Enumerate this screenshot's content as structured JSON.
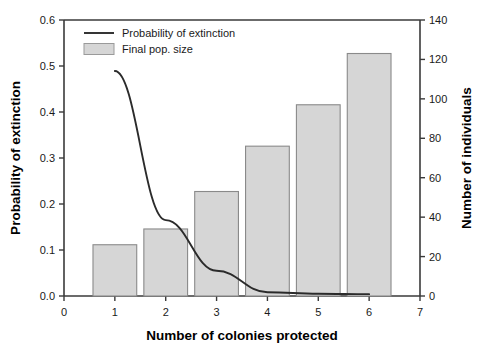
{
  "chart_data": {
    "type": "bar",
    "title": "",
    "subtitle": "",
    "xlabel": "Number of colonies protected",
    "ylabel": "Probability of extinction",
    "y2label": "Number of individuals",
    "categories": [
      "1",
      "2",
      "3",
      "4",
      "5",
      "6"
    ],
    "x": [
      1,
      2,
      3,
      4,
      5,
      6
    ],
    "xlim": [
      0,
      7
    ],
    "ylim": [
      0.0,
      0.6
    ],
    "y2lim": [
      0,
      140
    ],
    "grid": false,
    "legend_position": "top-left",
    "xticks": [
      "0",
      "1",
      "2",
      "3",
      "4",
      "5",
      "6",
      "7"
    ],
    "yticks": [
      "0.0",
      "0.1",
      "0.2",
      "0.3",
      "0.4",
      "0.5",
      "0.6"
    ],
    "y2ticks": [
      "0",
      "20",
      "40",
      "60",
      "80",
      "100",
      "120",
      "140"
    ],
    "series": [
      {
        "name": "Final pop. size",
        "type": "bar",
        "axis": "right",
        "unit": "individuals",
        "color": "#d6d6d6",
        "edge_color": "#8a8a8a",
        "values": [
          26,
          34,
          53,
          76,
          97,
          123
        ]
      },
      {
        "name": "Probability of extinction",
        "type": "line",
        "axis": "left",
        "color": "#2b2b2b",
        "x": [
          1,
          2,
          3,
          4,
          5,
          6
        ],
        "values": [
          0.489,
          0.165,
          0.055,
          0.008,
          0.005,
          0.004
        ]
      }
    ]
  },
  "legend": {
    "items": [
      {
        "label": "Probability of extinction",
        "marker": "line"
      },
      {
        "label": "Final pop. size",
        "marker": "swatch"
      }
    ]
  }
}
